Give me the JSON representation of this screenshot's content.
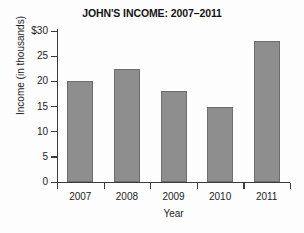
{
  "chart_data": {
    "type": "bar",
    "title": "JOHN'S INCOME: 2007–2011",
    "xlabel": "Year",
    "ylabel": "Income  (in thousands)",
    "categories": [
      "2007",
      "2008",
      "2009",
      "2010",
      "2011"
    ],
    "values": [
      20,
      22.5,
      18,
      15,
      28
    ],
    "ylim": [
      0,
      30
    ],
    "ytick_values": [
      30,
      25,
      20,
      15,
      10,
      5,
      0
    ],
    "ytick_labels": [
      "$30",
      "25",
      "20",
      "15",
      "10",
      "5",
      "0"
    ],
    "grid": false,
    "legend": null,
    "bar_color": "#8e8e8e",
    "bar_border_color": "#6d6d6d",
    "axis_color": "#3b3b3b",
    "background_color": "#fdfdfd"
  }
}
